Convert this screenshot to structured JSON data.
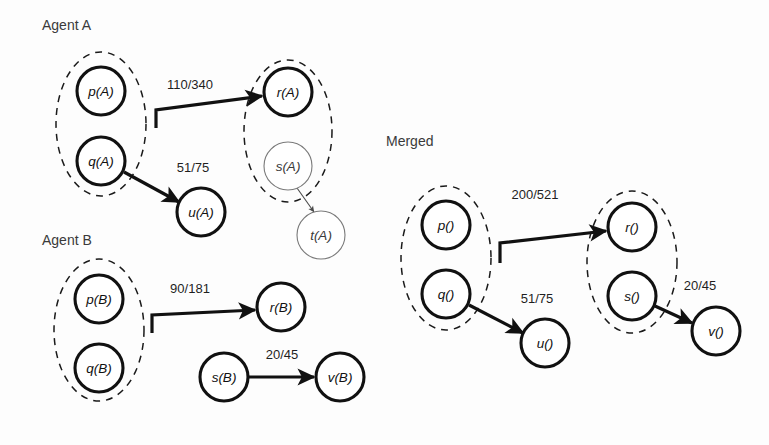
{
  "figure": {
    "background": "#fdfdfd",
    "ink": "#111111"
  },
  "sections": [
    {
      "id": "agent-a",
      "title": "Agent A",
      "title_pos": {
        "x": 42,
        "y": 30
      }
    },
    {
      "id": "agent-b",
      "title": "Agent B",
      "title_pos": {
        "x": 42,
        "y": 245
      }
    },
    {
      "id": "merged",
      "title": "Merged",
      "title_pos": {
        "x": 386,
        "y": 146
      }
    }
  ],
  "groups": [
    {
      "id": "agent-a-left",
      "section": "agent-a",
      "cx": 101,
      "cy": 124,
      "rx": 45,
      "ry": 72
    },
    {
      "id": "agent-a-right",
      "section": "agent-a",
      "cx": 288,
      "cy": 131,
      "rx": 44,
      "ry": 71
    },
    {
      "id": "agent-b-left",
      "section": "agent-b",
      "cx": 99,
      "cy": 330,
      "rx": 45,
      "ry": 71
    },
    {
      "id": "merged-left",
      "section": "merged",
      "cx": 446,
      "cy": 258,
      "rx": 45,
      "ry": 72
    },
    {
      "id": "merged-right",
      "section": "merged",
      "cx": 632,
      "cy": 262,
      "rx": 45,
      "ry": 71
    }
  ],
  "nodes": [
    {
      "id": "pA",
      "section": "agent-a",
      "label": "p(A)",
      "cx": 101,
      "cy": 91,
      "r": 24,
      "style": "bold"
    },
    {
      "id": "qA",
      "section": "agent-a",
      "label": "q(A)",
      "cx": 101,
      "cy": 161,
      "r": 24,
      "style": "bold"
    },
    {
      "id": "rA",
      "section": "agent-a",
      "label": "r(A)",
      "cx": 288,
      "cy": 92,
      "r": 24,
      "style": "bold"
    },
    {
      "id": "sA",
      "section": "agent-a",
      "label": "s(A)",
      "cx": 288,
      "cy": 166,
      "r": 24,
      "style": "thin"
    },
    {
      "id": "uA",
      "section": "agent-a",
      "label": "u(A)",
      "cx": 201,
      "cy": 212,
      "r": 24,
      "style": "bold"
    },
    {
      "id": "tA",
      "section": "agent-a",
      "label": "t(A)",
      "cx": 321,
      "cy": 235,
      "r": 24,
      "style": "thin"
    },
    {
      "id": "pB",
      "section": "agent-b",
      "label": "p(B)",
      "cx": 99,
      "cy": 299,
      "r": 24,
      "style": "bold"
    },
    {
      "id": "qB",
      "section": "agent-b",
      "label": "q(B)",
      "cx": 99,
      "cy": 368,
      "r": 24,
      "style": "bold"
    },
    {
      "id": "rB",
      "section": "agent-b",
      "label": "r(B)",
      "cx": 281,
      "cy": 307,
      "r": 24,
      "style": "bold"
    },
    {
      "id": "sB",
      "section": "agent-b",
      "label": "s(B)",
      "cx": 224,
      "cy": 377,
      "r": 24,
      "style": "bold"
    },
    {
      "id": "vB",
      "section": "agent-b",
      "label": "v(B)",
      "cx": 340,
      "cy": 377,
      "r": 24,
      "style": "bold"
    },
    {
      "id": "pM",
      "section": "merged",
      "label": "p()",
      "cx": 446,
      "cy": 225,
      "r": 24,
      "style": "bold"
    },
    {
      "id": "qM",
      "section": "merged",
      "label": "q()",
      "cx": 446,
      "cy": 294,
      "r": 24,
      "style": "bold"
    },
    {
      "id": "rM",
      "section": "merged",
      "label": "r()",
      "cx": 632,
      "cy": 227,
      "r": 24,
      "style": "bold"
    },
    {
      "id": "sM",
      "section": "merged",
      "label": "s()",
      "cx": 632,
      "cy": 296,
      "r": 24,
      "style": "bold"
    },
    {
      "id": "uM",
      "section": "merged",
      "label": "u()",
      "cx": 545,
      "cy": 343,
      "r": 24,
      "style": "bold"
    },
    {
      "id": "vM",
      "section": "merged",
      "label": "v()",
      "cx": 716,
      "cy": 331,
      "r": 24,
      "style": "bold"
    }
  ],
  "edges": [
    {
      "id": "a-group-to-rA",
      "section": "agent-a",
      "label": "110/340",
      "label_pos": {
        "x": 190,
        "y": 89
      },
      "path": "M 156,128 L 156,110 L 262,96",
      "style": "bold"
    },
    {
      "id": "qA-to-uA",
      "section": "agent-a",
      "label": "51/75",
      "label_pos": {
        "x": 193,
        "y": 172
      },
      "path": "M 124,172 L 179,202",
      "style": "bold"
    },
    {
      "id": "sA-to-tA",
      "section": "agent-a",
      "label": "",
      "label_pos": null,
      "path": "M 297,188 L 314,212",
      "style": "thin"
    },
    {
      "id": "b-group-to-rB",
      "section": "agent-b",
      "label": "90/181",
      "label_pos": {
        "x": 190,
        "y": 293
      },
      "path": "M 152,333 L 152,315 L 255,310",
      "style": "bold"
    },
    {
      "id": "sB-to-vB",
      "section": "agent-b",
      "label": "20/45",
      "label_pos": {
        "x": 282,
        "y": 359
      },
      "path": "M 248,377 L 314,377",
      "style": "bold"
    },
    {
      "id": "m-group-to-rM",
      "section": "merged",
      "label": "200/521",
      "label_pos": {
        "x": 535,
        "y": 199
      },
      "path": "M 500,263 L 500,243 L 606,231",
      "style": "bold"
    },
    {
      "id": "qM-to-uM",
      "section": "merged",
      "label": "51/75",
      "label_pos": {
        "x": 537,
        "y": 303
      },
      "path": "M 469,305 L 523,333",
      "style": "bold"
    },
    {
      "id": "sM-to-vM",
      "section": "merged",
      "label": "20/45",
      "label_pos": {
        "x": 700,
        "y": 290
      },
      "path": "M 655,306 L 692,323",
      "style": "bold"
    }
  ]
}
